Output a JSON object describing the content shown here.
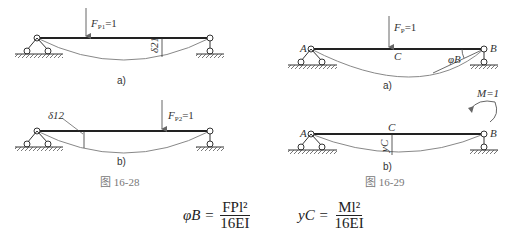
{
  "figure_16_28": {
    "caption": "图   16-28",
    "a": {
      "label": "a)",
      "load": "F",
      "load_sub": "P1",
      "load_val": "=1",
      "deflection": "δ21"
    },
    "b": {
      "label": "b)",
      "load": "F",
      "load_sub": "P2",
      "load_val": "=1",
      "deflection": "δ12"
    }
  },
  "figure_16_29": {
    "caption": "图   16-29",
    "a": {
      "label": "a)",
      "load": "F",
      "load_sub": "P",
      "load_val": "=1",
      "point_a": "A",
      "point_b": "B",
      "point_c": "C",
      "rotation": "φB"
    },
    "b": {
      "label": "b)",
      "moment": "M=1",
      "point_a": "A",
      "point_b": "B",
      "point_c": "C",
      "deflection": "yC"
    }
  },
  "equations": {
    "eq1_lhs": "φB =",
    "eq1_num": "FPl²",
    "eq1_den": "16EI",
    "eq2_lhs": "yC =",
    "eq2_num": "Ml²",
    "eq2_den": "16EI"
  }
}
